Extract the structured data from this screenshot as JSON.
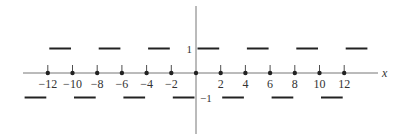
{
  "chart_data": {
    "type": "line",
    "title": "",
    "xlabel": "x",
    "ylabel": "",
    "xlim": [
      -14,
      14
    ],
    "ylim": [
      -1,
      1
    ],
    "grid": false,
    "x_ticks": [
      -12,
      -10,
      -8,
      -6,
      -4,
      -2,
      2,
      4,
      6,
      8,
      10,
      12
    ],
    "x_tick_labels": [
      "−12",
      "−10",
      "−8",
      "−6",
      "−4",
      "−2",
      "2",
      "4",
      "6",
      "8",
      "10",
      "12"
    ],
    "y_tick_labels": [
      "1",
      "−1"
    ],
    "dots_at_x": [
      -12,
      -10,
      -8,
      -6,
      -4,
      -2,
      0,
      2,
      4,
      6,
      8,
      10,
      12
    ],
    "series": [
      {
        "name": "square wave",
        "segments": [
          {
            "x": [
              -14,
              -12
            ],
            "y": -1
          },
          {
            "x": [
              -12,
              -10
            ],
            "y": 1
          },
          {
            "x": [
              -10,
              -8
            ],
            "y": -1
          },
          {
            "x": [
              -8,
              -6
            ],
            "y": 1
          },
          {
            "x": [
              -6,
              -4
            ],
            "y": -1
          },
          {
            "x": [
              -4,
              -2
            ],
            "y": 1
          },
          {
            "x": [
              -2,
              0
            ],
            "y": -1
          },
          {
            "x": [
              0,
              2
            ],
            "y": 1
          },
          {
            "x": [
              2,
              4
            ],
            "y": -1
          },
          {
            "x": [
              4,
              6
            ],
            "y": 1
          },
          {
            "x": [
              6,
              8
            ],
            "y": -1
          },
          {
            "x": [
              8,
              10
            ],
            "y": 1
          },
          {
            "x": [
              10,
              12
            ],
            "y": -1
          },
          {
            "x": [
              12,
              14
            ],
            "y": 1
          }
        ]
      }
    ]
  },
  "colors": {
    "axis": "#777777",
    "line": "#222222",
    "text": "#333333"
  }
}
